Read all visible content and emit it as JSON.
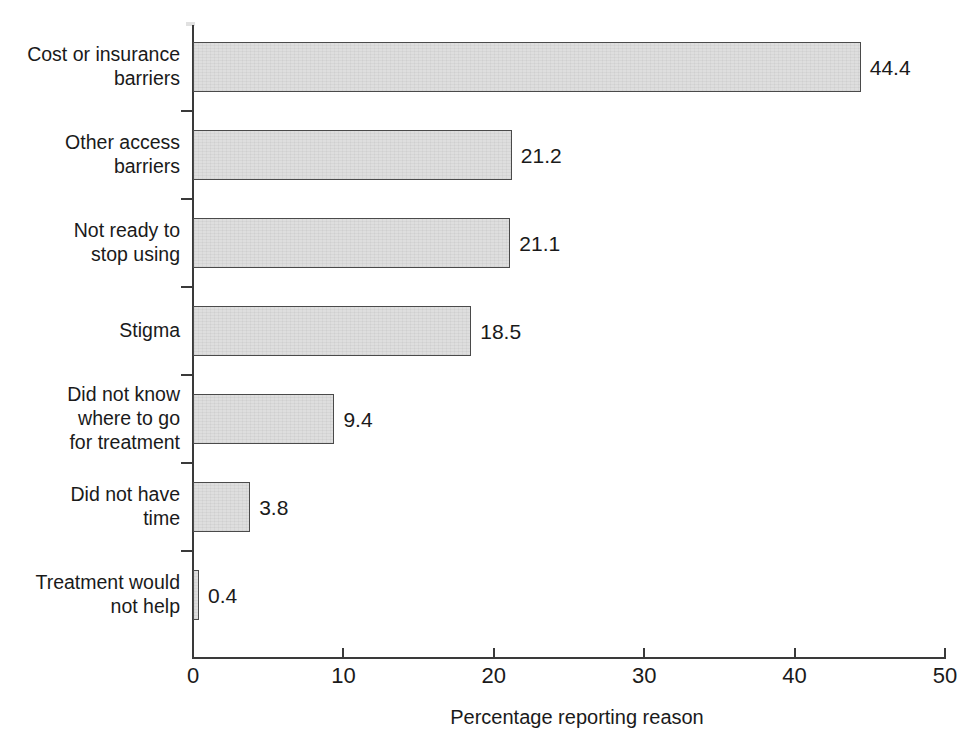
{
  "chart_data": {
    "type": "bar",
    "orientation": "horizontal",
    "title": "",
    "xlabel": "Percentage reporting reason",
    "ylabel": "",
    "xlim": [
      0,
      50
    ],
    "xticks": [
      0,
      10,
      20,
      30,
      40,
      50
    ],
    "xtick_labels": [
      "0",
      "10",
      "20",
      "30",
      "40",
      "50"
    ],
    "grid": false,
    "legend": false,
    "categories": [
      "Cost or insurance\nbarriers",
      "Other access\nbarriers",
      "Not ready to\nstop using",
      "Stigma",
      "Did not know\nwhere to go\nfor treatment",
      "Did not have\ntime",
      "Treatment would\nnot help"
    ],
    "values": [
      44.4,
      21.2,
      21.1,
      18.5,
      9.4,
      3.8,
      0.4
    ],
    "value_labels": [
      "44.4",
      "21.2",
      "21.1",
      "18.5",
      "9.4",
      "3.8",
      "0.4"
    ],
    "bar_fill_color": "#dedede",
    "bar_edge_color": "#4a4a4a",
    "axis_color": "#3a3a3a",
    "background_color": "#ffffff"
  }
}
